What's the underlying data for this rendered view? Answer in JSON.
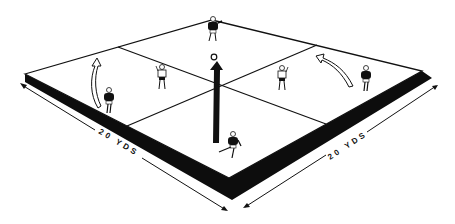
{
  "diagram": {
    "type": "soccer drill field, isometric",
    "colors": {
      "line": "#111111",
      "band": "#0d0d0d",
      "field": "#ffffff"
    },
    "field": {
      "corners": {
        "left": [
          25,
          74
        ],
        "top": [
          212,
          20
        ],
        "right": [
          422,
          71
        ],
        "bottom": [
          229,
          178
        ]
      },
      "center": [
        218,
        80
      ]
    },
    "dimension_labels": [
      {
        "id": "left",
        "text": "20 YDS"
      },
      {
        "id": "right",
        "text": "20 YDS"
      }
    ],
    "players": [
      {
        "id": "top",
        "team": "dark"
      },
      {
        "id": "left-wing",
        "team": "dark"
      },
      {
        "id": "right-wing",
        "team": "dark"
      },
      {
        "id": "bottom",
        "team": "dark"
      },
      {
        "id": "left-center",
        "team": "light"
      },
      {
        "id": "right-center",
        "team": "light"
      }
    ],
    "arrows": [
      {
        "id": "center-pass",
        "style": "solid"
      },
      {
        "id": "left-run",
        "style": "outline"
      },
      {
        "id": "right-run",
        "style": "outline"
      }
    ],
    "ball": {
      "position": [
        213,
        57
      ]
    }
  }
}
